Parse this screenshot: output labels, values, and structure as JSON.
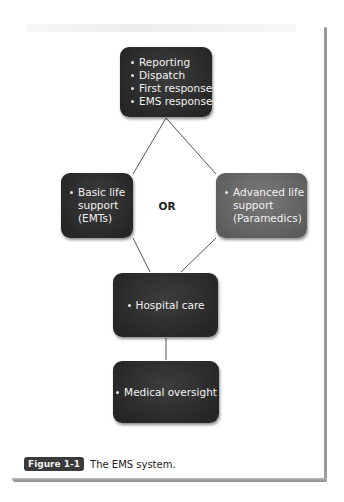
{
  "figure": {
    "label": "Figure 1-1",
    "caption": "The EMS system."
  },
  "nodes": {
    "top": {
      "items": [
        "Reporting",
        "Dispatch",
        "First response",
        "EMS response"
      ]
    },
    "basic": {
      "first_line": "Basic life",
      "lines": [
        "support",
        "(EMTs)"
      ]
    },
    "advanced": {
      "first_line": "Advanced life",
      "lines": [
        "support",
        "(Paramedics)"
      ]
    },
    "hospital": {
      "items": [
        "Hospital care"
      ]
    },
    "oversight": {
      "items": [
        "Medical oversight"
      ]
    }
  },
  "connector_label": "OR",
  "colors": {
    "node_dark": "#2e2e2e",
    "node_gray": "#6b6b6b",
    "node_text": "#f2f2f2",
    "line": "#555555",
    "badge": "#3a3a3a"
  }
}
